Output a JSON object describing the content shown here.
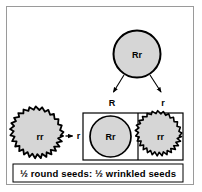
{
  "diagram": {
    "parent": {
      "genotype": "Rr",
      "seed_shape": "round"
    },
    "gametes_from_parent": [
      {
        "allele": "R",
        "position": "left"
      },
      {
        "allele": "r",
        "position": "right"
      }
    ],
    "tester_parent": {
      "genotype": "rr",
      "seed_shape": "wrinkled",
      "gamete": "r"
    },
    "offspring_cells": [
      {
        "genotype": "Rr",
        "seed_shape": "round"
      },
      {
        "genotype": "rr",
        "seed_shape": "wrinkled"
      }
    ],
    "ratio_caption": "½ round seeds: ½ wrinkled seeds",
    "colors": {
      "seed_fill": "#d6d6d6",
      "seed_outline": "#000000",
      "frame_border": "#9a9a9a",
      "box_border": "#000000",
      "background": "#ffffff",
      "arrow": "#000000"
    }
  }
}
